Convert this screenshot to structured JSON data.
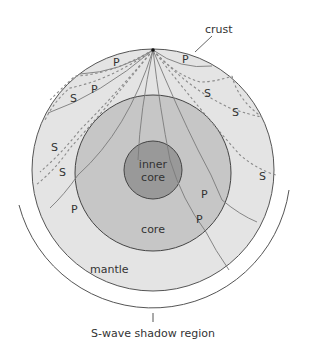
{
  "figure": {
    "type": "cross-section",
    "colors": {
      "background": "#ffffff",
      "mantle_fill": "#e4e4e4",
      "core_fill": "#c6c6c6",
      "inner_core_fill": "#999999",
      "outline": "#555555",
      "p_wave_line": "#7a7a7a",
      "s_wave_line": "#8a8a8a",
      "text": "#333333"
    },
    "labels": {
      "crust": "crust",
      "mantle": "mantle",
      "core": "core",
      "inner_core_line1": "inner",
      "inner_core_line2": "core",
      "shadow_region": "S-wave shadow region"
    },
    "wave_labels": {
      "p": "P",
      "s": "S"
    },
    "legend": {
      "p_wave": "P",
      "s_wave": "S"
    }
  }
}
